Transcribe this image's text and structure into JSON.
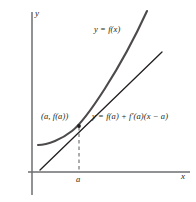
{
  "figure": {
    "type": "math-diagram",
    "background_color": "#ffffff",
    "ink_color": "#231f20",
    "axes": {
      "y_axis_label": "y",
      "x_axis_label": "x",
      "origin_px": {
        "x": 32,
        "y": 172
      },
      "x_axis_span_px": {
        "from": 28,
        "to": 190
      },
      "y_axis_span_px": {
        "from": 12,
        "to": 195
      }
    },
    "ticks": {
      "x": [
        {
          "label": "a",
          "px": 79
        }
      ]
    },
    "labels": {
      "curve": "y = f(x)",
      "point": "(a, f(a))",
      "tangent": "y = f(a) + f′(a)(x − a)"
    },
    "tangency_point_px": {
      "x": 79,
      "y": 126
    }
  },
  "chart_data": {
    "type": "line",
    "title": "",
    "xlabel": "x",
    "ylabel": "y",
    "grid": false,
    "legend": "none",
    "annotations": [
      {
        "text": "y = f(x)",
        "x_px": 94,
        "y_px": 25
      },
      {
        "text": "(a, f(a))",
        "x_px": 41,
        "y_px": 112
      },
      {
        "text": "y = f(a) + f′(a)(x − a)",
        "x_px": 92,
        "y_px": 112
      },
      {
        "text": "a",
        "x_px": 76,
        "y_px": 175
      },
      {
        "text": "y",
        "x_px": 35,
        "y_px": 9
      },
      {
        "text": "x",
        "x_px": 181,
        "y_px": 172
      }
    ],
    "series": [
      {
        "name": "y = f(x)",
        "kind": "curve",
        "stroke_width": 2.1,
        "path": "M 38 145 C 48 145, 62 139, 72 131 C 86 120, 120 70, 147 11"
      },
      {
        "name": "y = f(a) + f′(a)(x − a)",
        "kind": "tangent-line",
        "stroke_width": 1.3,
        "path": "M 40 170 L 162 52"
      },
      {
        "name": "vertical-drop-at-a",
        "kind": "dashed",
        "stroke_width": 1,
        "path": "M 79 127 L 79 171"
      }
    ]
  }
}
